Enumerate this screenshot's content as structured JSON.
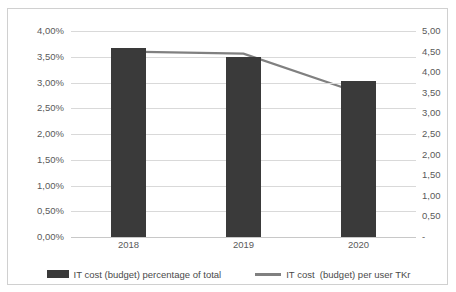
{
  "chart_data": {
    "type": "bar",
    "title": "",
    "xlabel": "",
    "categories": [
      "2018",
      "2019",
      "2020"
    ],
    "grid": true,
    "legend_position": "bottom",
    "series": [
      {
        "name": "IT cost (budget) percentage of total",
        "type": "bar",
        "axis": "left",
        "color": "#3a3a3a",
        "values": [
          3.67,
          3.5,
          3.02
        ],
        "unit": "%"
      },
      {
        "name": "IT cost  (budget) per user TKr",
        "type": "line",
        "axis": "right",
        "color": "#808080",
        "values": [
          4.5,
          4.45,
          3.5
        ],
        "unit": "TKr"
      }
    ],
    "axes": {
      "left": {
        "label": "",
        "ylim": [
          0,
          4.0
        ],
        "step": 0.5,
        "ticks": [
          "4,00%",
          "3,50%",
          "3,00%",
          "2,50%",
          "2,00%",
          "1,50%",
          "1,00%",
          "0,50%",
          "0,00%"
        ],
        "tick_values": [
          4.0,
          3.5,
          3.0,
          2.5,
          2.0,
          1.5,
          1.0,
          0.5,
          0.0
        ]
      },
      "right": {
        "label": "",
        "ylim": [
          0,
          5.0
        ],
        "step": 0.5,
        "ticks": [
          "5,00",
          "4,50",
          "4,00",
          "3,50",
          "3,00",
          "2,50",
          "2,00",
          "1,50",
          "1,00",
          "0,50",
          "-"
        ],
        "tick_values": [
          5.0,
          4.5,
          4.0,
          3.5,
          3.0,
          2.5,
          2.0,
          1.5,
          1.0,
          0.5,
          0.0
        ]
      }
    }
  },
  "legend": {
    "items": [
      {
        "label": "IT cost (budget) percentage of total",
        "marker": "bar-swatch"
      },
      {
        "label": "IT cost  (budget) per user TKr",
        "marker": "line-swatch"
      }
    ]
  },
  "colors": {
    "bar": "#3a3a3a",
    "line": "#808080",
    "gridline": "#d9d9d9",
    "axis_text": "#5a5a5a",
    "frame_border": "#d0d0d0",
    "background": "#ffffff"
  }
}
